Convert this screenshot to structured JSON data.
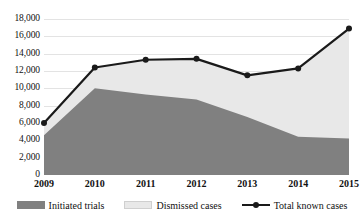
{
  "chart_data": {
    "type": "area",
    "title": "",
    "subtitle": "",
    "xlabel": "",
    "ylabel": "",
    "categories": [
      "2009",
      "2010",
      "2011",
      "2012",
      "2013",
      "2014",
      "2015"
    ],
    "x": [
      2009,
      2010,
      2011,
      2012,
      2013,
      2014,
      2015
    ],
    "ylim": [
      0,
      18000
    ],
    "ytick_values": [
      0,
      2000,
      4000,
      6000,
      8000,
      10000,
      12000,
      14000,
      16000,
      18000
    ],
    "ytick_labels": [
      "0",
      "2,000",
      "4,000",
      "6,000",
      "8,000",
      "10,000",
      "12,000",
      "14,000",
      "16,000",
      "18,000"
    ],
    "grid": true,
    "legend_position": "bottom",
    "stacked": true,
    "series": [
      {
        "name": "Initiated trials",
        "type": "area",
        "color": "#808080",
        "values": [
          4600,
          10000,
          9300,
          8700,
          6700,
          4400,
          4200
        ]
      },
      {
        "name": "Dismissed cases",
        "type": "area",
        "color": "#e8e8e8",
        "values": [
          1400,
          2400,
          4000,
          4700,
          4800,
          7900,
          12700
        ]
      },
      {
        "name": "Total known cases",
        "type": "line",
        "color": "#1a1a1a",
        "marker": "circle",
        "values": [
          6000,
          12400,
          13300,
          13400,
          11500,
          12300,
          16900
        ]
      }
    ]
  },
  "legend": {
    "items": [
      {
        "label": "Initiated trials",
        "swatch": "dark-area-swatch"
      },
      {
        "label": "Dismissed cases",
        "swatch": "light-area-swatch"
      },
      {
        "label": "Total known cases",
        "swatch": "line-marker-swatch"
      }
    ]
  },
  "colors": {
    "initiated_trials": "#808080",
    "dismissed_cases": "#e8e8e8",
    "total_known_cases": "#1a1a1a",
    "gridline": "#e3e3e3",
    "background": "#ffffff"
  }
}
